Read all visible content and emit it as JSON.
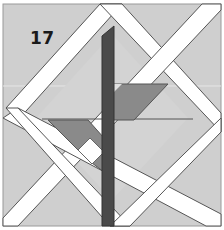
{
  "diagram": {
    "type": "quilt-block",
    "block_number": "17",
    "colors": {
      "background": "#cfcfcf",
      "strip": "#ffffff",
      "strip_edge": "#555555",
      "stem": "#4a4a4a",
      "leaf": "#888888",
      "leaf_light": "#e2e2e2",
      "frame": "#bdbdbd"
    },
    "pieces": [
      {
        "name": "background",
        "shape": "square"
      },
      {
        "name": "diagonal-strips",
        "shape": "white lattice strips forming diamond"
      },
      {
        "name": "stem",
        "shape": "dark vertical bar"
      },
      {
        "name": "upper-leaf",
        "shape": "medium gray parallelogram right of stem"
      },
      {
        "name": "lower-leaf",
        "shape": "medium gray parallelogram left of stem"
      }
    ]
  }
}
